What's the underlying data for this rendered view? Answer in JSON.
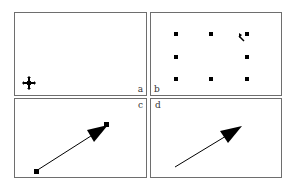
{
  "figure": {
    "panels": [
      {
        "id": "a",
        "label": "a",
        "content": "move-cursor only"
      },
      {
        "id": "b",
        "label": "b",
        "content": "selection handles (8) with resize cursor at top-right"
      },
      {
        "id": "c",
        "label": "c",
        "content": "selected arrow line with endpoint handles"
      },
      {
        "id": "d",
        "label": "d",
        "content": "unselected arrow line"
      }
    ],
    "colors": {
      "border": "#6e6e6e",
      "ink": "#000000",
      "background": "#ffffff"
    }
  }
}
